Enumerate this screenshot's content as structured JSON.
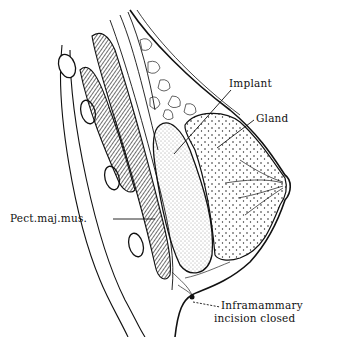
{
  "diagram": {
    "labels": {
      "implant": "Implant",
      "gland": "Gland",
      "pect_maj_mus": "Pect.maj.mus.",
      "inframammary_line1": "Inframammary",
      "inframammary_line2": "incision closed"
    },
    "colors": {
      "ink": "#111111",
      "background": "#ffffff",
      "muscle_fill": "#8a8a8a",
      "implant_fill": "#f4f4f4"
    }
  }
}
